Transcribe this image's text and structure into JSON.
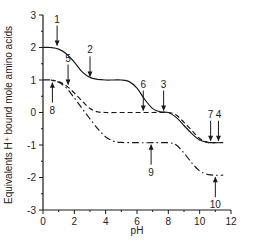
{
  "chart_data": {
    "type": "line",
    "title": "",
    "xlabel": "pH",
    "ylabel": "Equivalents H⁺ bound mole amino acids",
    "xlim": [
      0,
      12
    ],
    "ylim": [
      -3,
      3
    ],
    "x_ticks": [
      0,
      2,
      4,
      6,
      8,
      10,
      12
    ],
    "x_tick_labels": [
      "0",
      "2",
      "4",
      "6",
      "8",
      "10",
      "12"
    ],
    "y_ticks": [
      -3,
      -2,
      -1,
      0,
      1,
      2,
      3
    ],
    "y_tick_labels": [
      "-3",
      "-2",
      "-1",
      "0",
      "1",
      "2",
      "3"
    ],
    "grid": false,
    "legend": null,
    "series": [
      {
        "name": "solid curve",
        "style": "solid",
        "x": [
          0,
          0.5,
          1,
          1.5,
          2,
          2.5,
          3,
          3.5,
          4,
          4.5,
          5,
          5.5,
          6,
          6.5,
          7,
          7.5,
          8,
          8.5,
          9,
          9.5,
          10,
          10.5,
          11,
          11.5
        ],
        "y": [
          2,
          2,
          1.95,
          1.8,
          1.55,
          1.25,
          1.08,
          1.02,
          1.0,
          1.0,
          1.0,
          0.95,
          0.75,
          0.4,
          0.12,
          0.02,
          0.0,
          -0.15,
          -0.4,
          -0.65,
          -0.85,
          -0.92,
          -0.93,
          -0.93
        ]
      },
      {
        "name": "dashed curve",
        "style": "dashed",
        "x": [
          0.5,
          1,
          1.5,
          2,
          2.5,
          3,
          3.5,
          4,
          5,
          6,
          7,
          8,
          8.5,
          9,
          9.5,
          10,
          10.5,
          11
        ],
        "y": [
          1.0,
          0.95,
          0.82,
          0.6,
          0.35,
          0.12,
          0.02,
          0.0,
          0.0,
          0.0,
          0.0,
          0.0,
          -0.08,
          -0.3,
          -0.55,
          -0.8,
          -0.92,
          -0.93
        ]
      },
      {
        "name": "dash-dot curve",
        "style": "dash-dot",
        "x": [
          0,
          0.5,
          1,
          1.5,
          2,
          2.5,
          3,
          3.5,
          4,
          4.5,
          5,
          6,
          7,
          8,
          8.5,
          9,
          9.5,
          10,
          10.5,
          11,
          11.5
        ],
        "y": [
          1.0,
          1.0,
          0.93,
          0.75,
          0.45,
          0.12,
          -0.2,
          -0.5,
          -0.75,
          -0.88,
          -0.92,
          -0.93,
          -0.93,
          -0.93,
          -1.0,
          -1.25,
          -1.55,
          -1.8,
          -1.9,
          -1.93,
          -1.93
        ]
      }
    ],
    "annotations": [
      {
        "label": "1",
        "x": 0.9,
        "y": 2.0,
        "arrow": "down"
      },
      {
        "label": "2",
        "x": 3.0,
        "y": 1.05,
        "arrow": "down"
      },
      {
        "label": "3",
        "x": 7.7,
        "y": 0.0,
        "arrow": "down"
      },
      {
        "label": "4",
        "x": 11.2,
        "y": -0.93,
        "arrow": "down"
      },
      {
        "label": "5",
        "x": 1.6,
        "y": 0.8,
        "arrow": "down"
      },
      {
        "label": "6",
        "x": 6.4,
        "y": 0.0,
        "arrow": "down"
      },
      {
        "label": "7",
        "x": 10.7,
        "y": -0.93,
        "arrow": "down"
      },
      {
        "label": "8",
        "x": 0.6,
        "y": 0.98,
        "arrow": "up"
      },
      {
        "label": "9",
        "x": 6.9,
        "y": -0.93,
        "arrow": "up"
      },
      {
        "label": "10",
        "x": 11.0,
        "y": -1.93,
        "arrow": "up"
      }
    ]
  }
}
